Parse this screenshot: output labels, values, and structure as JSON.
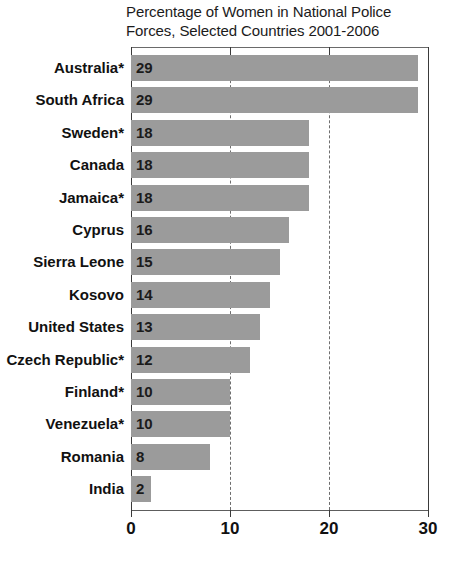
{
  "chart_data": {
    "type": "bar",
    "orientation": "horizontal",
    "title": "Percentage of Women in National Police Forces, Selected Countries 2001-2006",
    "title_lines": [
      "Percentage of Women in National Police",
      "Forces, Selected Countries 2001-2006"
    ],
    "xlabel": "",
    "ylabel": "",
    "xlim": [
      0,
      30
    ],
    "xticks": [
      0,
      10,
      20,
      30
    ],
    "xtick_labels": [
      "0",
      "10",
      "20",
      "30"
    ],
    "grid": "vertical-dashed",
    "legend": "none",
    "bar_color": "#9b9b9b",
    "categories": [
      "Australia*",
      "South Africa",
      "Sweden*",
      "Canada",
      "Jamaica*",
      "Cyprus",
      "Sierra Leone",
      "Kosovo",
      "United States",
      "Czech Republic*",
      "Finland*",
      "Venezuela*",
      "Romania",
      "India"
    ],
    "values": [
      29,
      29,
      18,
      18,
      18,
      16,
      15,
      14,
      13,
      12,
      10,
      10,
      8,
      2
    ],
    "value_labels": [
      "29",
      "29",
      "18",
      "18",
      "18",
      "16",
      "15",
      "14",
      "13",
      "12",
      "10",
      "10",
      "8",
      "2"
    ]
  }
}
